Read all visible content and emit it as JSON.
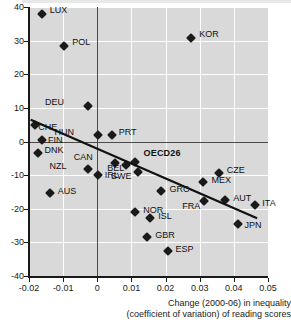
{
  "chart_data": {
    "type": "scatter",
    "title": "",
    "xlabel": "Change (2000-06) in inequality (coefficient of variation) of reading scores",
    "xlabel_line1": "Change (2000-06) in inequality",
    "xlabel_line2": "(coefficient of variation) of reading scores",
    "ylabel": "",
    "xlim": [
      -0.02,
      0.05
    ],
    "ylim": [
      -40,
      40
    ],
    "xticks": [
      -0.02,
      -0.01,
      0,
      0.01,
      0.02,
      0.03,
      0.04,
      0.05
    ],
    "xtick_labels": [
      "-0.02",
      "-0.01",
      "0",
      "0.01",
      "0.02",
      "0.03",
      "0.04",
      "0.05"
    ],
    "yticks": [
      40,
      30,
      20,
      10,
      0,
      -10,
      -20,
      -30,
      -40
    ],
    "ytick_labels": [
      "40",
      "30",
      "20",
      "10",
      "0",
      "-10",
      "-20",
      "-30",
      "-40"
    ],
    "grid": true,
    "legend": "none",
    "marker": "diamond",
    "marker_color": "#1a1a1a",
    "panel_color": "#d9d9d9",
    "gridline_color": "#ffffff",
    "trendline": {
      "color": "#111111",
      "x0": -0.0195,
      "y0": 6.5,
      "x1": 0.0468,
      "y1": -22.8
    },
    "points": [
      {
        "label": "LUX",
        "x": -0.0163,
        "y": 38.0,
        "lx": 8,
        "ly": -4,
        "bold": false
      },
      {
        "label": "POL",
        "x": -0.0097,
        "y": 28.5,
        "lx": 8,
        "ly": -4,
        "bold": false
      },
      {
        "label": "KOR",
        "x": 0.0275,
        "y": 30.8,
        "lx": 8,
        "ly": -4,
        "bold": false
      },
      {
        "label": "DEU",
        "x": -0.0027,
        "y": 10.6,
        "lx": -28,
        "ly": -4,
        "bold": false
      },
      {
        "label": "CHE",
        "x": -0.0182,
        "y": 4.8,
        "lx": 3,
        "ly": 2,
        "bold": false
      },
      {
        "label": "FIN",
        "x": -0.0162,
        "y": 0.5,
        "lx": 6,
        "ly": 0,
        "bold": false
      },
      {
        "label": "HUN",
        "x": 0.0002,
        "y": 2.0,
        "lx": -28,
        "ly": -3,
        "bold": false
      },
      {
        "label": "PRT",
        "x": 0.0042,
        "y": 2.0,
        "lx": 7,
        "ly": -3,
        "bold": false
      },
      {
        "label": "DNK",
        "x": -0.0175,
        "y": -3.3,
        "lx": 7,
        "ly": -3,
        "bold": false
      },
      {
        "label": "OECD26",
        "x": 0.0109,
        "y": -6.2,
        "lx": 9,
        "ly": -9,
        "bold": true
      },
      {
        "label": "CAN",
        "x": 0.0051,
        "y": -6.5,
        "lx": -26,
        "ly": -6,
        "bold": false
      },
      {
        "label": "BEL",
        "x": 0.0085,
        "y": -7.0,
        "lx": -6,
        "ly": 3,
        "bold": false
      },
      {
        "label": "NZL",
        "x": -0.0026,
        "y": -8.2,
        "lx": -26,
        "ly": -3,
        "bold": false
      },
      {
        "label": "IRL",
        "x": 0.0001,
        "y": -10.0,
        "lx": 7,
        "ly": 0,
        "bold": false
      },
      {
        "label": "SWE",
        "x": 0.0118,
        "y": -9.0,
        "lx": -10,
        "ly": 4,
        "bold": false
      },
      {
        "label": "CZE",
        "x": 0.0356,
        "y": -9.5,
        "lx": 8,
        "ly": -3,
        "bold": false
      },
      {
        "label": "MEX",
        "x": 0.0311,
        "y": -12.0,
        "lx": 8,
        "ly": -2,
        "bold": false
      },
      {
        "label": "GRC",
        "x": 0.0188,
        "y": -14.7,
        "lx": 8,
        "ly": -2,
        "bold": false
      },
      {
        "label": "AUS",
        "x": -0.0139,
        "y": -15.3,
        "lx": 8,
        "ly": -2,
        "bold": false
      },
      {
        "label": "AUT",
        "x": 0.0375,
        "y": -17.5,
        "lx": 8,
        "ly": -2,
        "bold": false
      },
      {
        "label": "FRA",
        "x": 0.0313,
        "y": -17.7,
        "lx": -8,
        "ly": 5,
        "bold": false
      },
      {
        "label": "ITA",
        "x": 0.0463,
        "y": -18.9,
        "lx": 7,
        "ly": -2,
        "bold": false
      },
      {
        "label": "NOR",
        "x": 0.0111,
        "y": -21.0,
        "lx": 8,
        "ly": -2,
        "bold": false
      },
      {
        "label": "ISL",
        "x": 0.0155,
        "y": -22.8,
        "lx": 8,
        "ly": -2,
        "bold": false
      },
      {
        "label": "JPN",
        "x": 0.0411,
        "y": -24.4,
        "lx": 7,
        "ly": 1,
        "bold": false
      },
      {
        "label": "GBR",
        "x": 0.0146,
        "y": -28.4,
        "lx": 8,
        "ly": -2,
        "bold": false
      },
      {
        "label": "ESP",
        "x": 0.0206,
        "y": -32.5,
        "lx": 8,
        "ly": -2,
        "bold": false
      }
    ]
  }
}
